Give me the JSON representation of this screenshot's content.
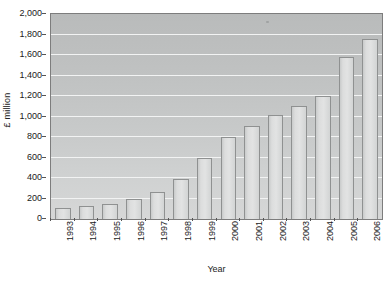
{
  "chart_data": {
    "type": "bar",
    "title": "",
    "xlabel": "Year",
    "ylabel": "£ million",
    "categories": [
      "1993",
      "1994",
      "1995",
      "1996",
      "1997",
      "1998",
      "1999",
      "2000",
      "2001",
      "2002",
      "2003",
      "2004",
      "2005",
      "2006"
    ],
    "values": [
      110,
      130,
      145,
      195,
      260,
      390,
      600,
      800,
      910,
      1015,
      1105,
      1200,
      1580,
      1760
    ],
    "ylim": [
      0,
      2000
    ],
    "y_ticks": [
      0,
      200,
      400,
      600,
      800,
      1000,
      1200,
      1400,
      1600,
      1800,
      2000
    ],
    "y_tick_labels": [
      "0",
      "200",
      "400",
      "600",
      "800",
      "1,000",
      "1,200",
      "1,400",
      "1,600",
      "1,800",
      "2,000"
    ],
    "grid": true,
    "legend": "none",
    "series": [
      {
        "name": "£ million",
        "values": [
          110,
          130,
          145,
          195,
          260,
          390,
          600,
          800,
          910,
          1015,
          1105,
          1200,
          1580,
          1760
        ]
      }
    ]
  },
  "colors": {
    "bar_fill": "#dcdddd",
    "bar_edge": "#8f9191",
    "plot_background": "#c2c4c4",
    "gridline": "#f2f3f3",
    "axis": "#555555",
    "text": "#1a1a1a"
  }
}
